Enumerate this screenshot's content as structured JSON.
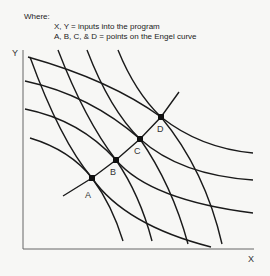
{
  "legend": {
    "heading": "Where:",
    "lines": [
      "X, Y = inputs into the program",
      "A, B, C, & D = points on the Engel curve"
    ]
  },
  "axes": {
    "x_label": "X",
    "y_label": "Y"
  },
  "points": [
    {
      "label": "A"
    },
    {
      "label": "B"
    },
    {
      "label": "C"
    },
    {
      "label": "D"
    }
  ],
  "curves": {
    "isoquant_count": 4,
    "steep_curve_count": 4,
    "expansion_path": "Engel curve"
  }
}
